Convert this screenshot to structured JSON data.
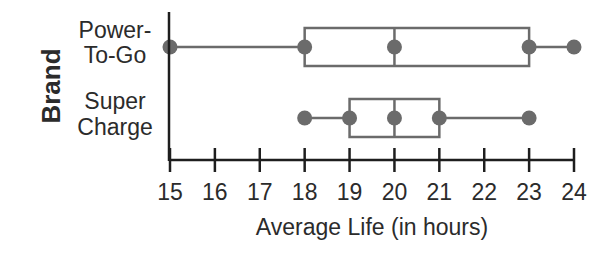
{
  "chart_data": {
    "type": "boxplot",
    "title": "",
    "xlabel": "Average Life (in hours)",
    "ylabel": "Brand",
    "xlim": [
      15,
      24
    ],
    "x_ticks": [
      15,
      16,
      17,
      18,
      19,
      20,
      21,
      22,
      23,
      24
    ],
    "grid": false,
    "legend": null,
    "categories": [
      "Power-To-Go",
      "Super Charge"
    ],
    "series": [
      {
        "name": "Power-To-Go",
        "label_lines": [
          "Power-",
          "To-Go"
        ],
        "min": 15,
        "q1": 18,
        "median": 20,
        "q3": 23,
        "max": 24
      },
      {
        "name": "Super Charge",
        "label_lines": [
          "Super",
          "Charge"
        ],
        "min": 18,
        "q1": 19,
        "median": 20,
        "q3": 21,
        "max": 23
      }
    ],
    "colors": {
      "axis": "#1e1e1e",
      "box": "#6b6b6b",
      "point": "#6b6b6b",
      "text": "#2b2b2b"
    }
  }
}
